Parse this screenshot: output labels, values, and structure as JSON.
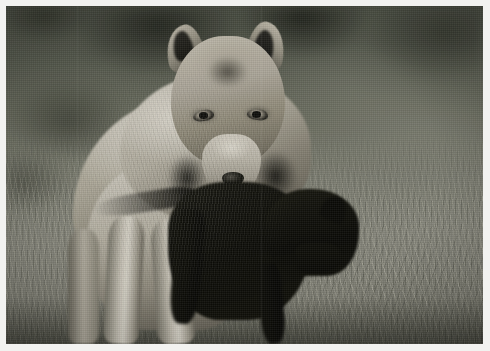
{
  "document": {
    "type": "photograph",
    "title": "Gray wolf carrying prey",
    "orientation": "landscape",
    "width_px": 490,
    "height_px": 351,
    "color_mode": "desaturated / near-monochrome color photograph",
    "border": {
      "present": true,
      "style": "light photographic margin",
      "color": "#f2f2f0",
      "thickness_px": 6
    }
  },
  "scene": {
    "subject": "Gray wolf walking toward the camera",
    "subject_action": "carrying a dark-furred prey animal in its jaws",
    "setting": "dry grassy meadow with blurred dark vegetation behind",
    "lighting": "soft overcast daylight",
    "depth_of_field": "shallow — background heavily blurred",
    "framing": "centred, subject fills middle of frame, head in upper third"
  },
  "subject": {
    "name": "gray-wolf",
    "parts": [
      {
        "name": "left-ear",
        "description": "erect, pale outer fur, dark inner ear"
      },
      {
        "name": "right-ear",
        "description": "erect, tipped slightly outward, dark inner ear"
      },
      {
        "name": "forehead",
        "description": "grizzled dark grey fur between the eyes"
      },
      {
        "name": "left-eye",
        "description": "pale amber iris, dark rim and pupil"
      },
      {
        "name": "right-eye",
        "description": "pale amber iris, dark rim and pupil"
      },
      {
        "name": "muzzle",
        "description": "pale cream-white muzzle"
      },
      {
        "name": "nose",
        "description": "dark nose pad"
      },
      {
        "name": "mouth",
        "description": "open, gripping dark prey"
      },
      {
        "name": "ruff",
        "description": "thick pale neck ruff framing the face"
      },
      {
        "name": "shoulder",
        "description": "broad pale grey shoulder mass on the left"
      },
      {
        "name": "chest",
        "description": "light cream chest fur"
      },
      {
        "name": "front-left-leg",
        "description": "pale leg, mid-stride"
      },
      {
        "name": "front-right-leg",
        "description": "pale leg, mid-stride"
      }
    ],
    "coat_tones": [
      "#e4e0d6",
      "#cac4b6",
      "#b3ada0",
      "#8a8577",
      "#5f5b50",
      "#45433a"
    ]
  },
  "prey": {
    "name": "carried-prey",
    "description": "dark, nearly black furred animal hanging from the wolf's jaws",
    "visible_parts": [
      "head",
      "ear",
      "snout",
      "body",
      "limbs",
      "tail"
    ],
    "tone": "#0c0c07"
  },
  "background": {
    "upper": "dark blurred shrubs and shadow",
    "lower": "sunlit dry grass with fine striations",
    "tones": [
      "#4e5246",
      "#6a6d5f",
      "#85867a",
      "#8d8d82",
      "#6e6e64",
      "#1a1c14"
    ]
  },
  "palette": {
    "frame": "#f2f2f0",
    "background_dark": "#4e5246",
    "background_mid": "#7b7d70",
    "background_light": "#8d8d82",
    "fur_highlight": "#e4e0d6",
    "fur_mid": "#b3ada0",
    "fur_shadow": "#5b5749",
    "prey_black": "#0c0c07"
  },
  "caption": ""
}
